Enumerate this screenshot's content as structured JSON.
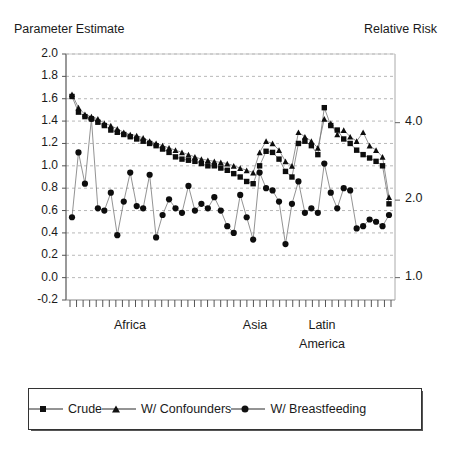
{
  "axes": {
    "left_title": "Parameter Estimate",
    "right_title": "Relative Risk",
    "left_ticks": [
      "2.0",
      "1.8",
      "1.6",
      "1.4",
      "1.2",
      "1.0",
      "0.8",
      "0.6",
      "0.4",
      "0.2",
      "0.0",
      "-0.2"
    ],
    "left_tick_values": [
      2.0,
      1.8,
      1.6,
      1.4,
      1.2,
      1.0,
      0.8,
      0.6,
      0.4,
      0.2,
      0.0,
      -0.2
    ],
    "right_ticks": [
      "4.0",
      "2.0",
      "1.0"
    ],
    "right_tick_values": [
      1.386,
      0.693,
      0.0
    ],
    "group_labels": [
      {
        "text": "Africa",
        "x": 130
      },
      {
        "text": "Asia",
        "x": 255
      },
      {
        "text": "Latin",
        "x": 322
      },
      {
        "text": "America",
        "x": 322
      }
    ]
  },
  "legend": {
    "items": [
      {
        "label": "Crude",
        "marker": "square"
      },
      {
        "label": "W/ Confounders",
        "marker": "triangle"
      },
      {
        "label": "W/ Breastfeeding",
        "marker": "circle"
      }
    ]
  },
  "chart_data": {
    "type": "line",
    "title": "",
    "subtitle": "",
    "xlabel": "",
    "ylabel": "Parameter Estimate",
    "y2label": "Relative Risk",
    "ylim": [
      -0.2,
      2.0
    ],
    "y2lim": [
      0.8187,
      7.389
    ],
    "y2_scale": "log",
    "grid": "horizontal-dashed",
    "legend_position": "bottom",
    "x_tick_count": 50,
    "x": [
      1,
      2,
      3,
      4,
      5,
      6,
      7,
      8,
      9,
      10,
      11,
      12,
      13,
      14,
      15,
      16,
      17,
      18,
      19,
      20,
      21,
      22,
      23,
      24,
      25,
      26,
      27,
      28,
      29,
      30,
      31,
      32,
      33,
      34,
      35,
      36,
      37,
      38,
      39,
      40,
      41,
      42,
      43,
      44,
      45,
      46,
      47,
      48,
      49,
      50
    ],
    "series": [
      {
        "name": "Crude",
        "marker": "square",
        "values": [
          1.62,
          1.48,
          1.44,
          1.42,
          1.39,
          1.36,
          1.32,
          1.3,
          1.28,
          1.26,
          1.24,
          1.22,
          1.2,
          1.18,
          1.15,
          1.12,
          1.08,
          1.06,
          1.05,
          1.04,
          1.02,
          1.0,
          1.0,
          0.98,
          0.96,
          0.93,
          0.9,
          0.86,
          0.84,
          1.0,
          1.13,
          1.12,
          1.06,
          0.95,
          0.9,
          1.2,
          1.22,
          1.18,
          1.1,
          1.52,
          1.36,
          1.32,
          1.24,
          1.2,
          1.14,
          1.1,
          1.07,
          1.04,
          1.0,
          0.66
        ]
      },
      {
        "name": "W/ Confounders",
        "marker": "triangle",
        "values": [
          1.64,
          1.52,
          1.46,
          1.44,
          1.42,
          1.38,
          1.36,
          1.33,
          1.3,
          1.28,
          1.27,
          1.25,
          1.22,
          1.2,
          1.18,
          1.16,
          1.14,
          1.12,
          1.1,
          1.08,
          1.06,
          1.05,
          1.04,
          1.03,
          1.02,
          1.0,
          0.98,
          0.96,
          0.94,
          1.12,
          1.22,
          1.2,
          1.14,
          1.04,
          1.0,
          1.3,
          1.26,
          1.22,
          1.16,
          1.42,
          1.38,
          1.28,
          1.32,
          1.26,
          1.22,
          1.3,
          1.18,
          1.14,
          1.08,
          0.72
        ]
      },
      {
        "name": "W/ Breastfeeding",
        "marker": "circle",
        "values": [
          0.54,
          1.12,
          0.84,
          1.42,
          0.62,
          0.6,
          0.76,
          0.38,
          0.68,
          0.94,
          0.64,
          0.62,
          0.92,
          0.36,
          0.56,
          0.7,
          0.62,
          0.58,
          0.82,
          0.6,
          0.66,
          0.62,
          0.72,
          0.6,
          0.46,
          0.4,
          0.74,
          0.54,
          0.34,
          0.94,
          0.8,
          0.78,
          0.68,
          0.3,
          0.66,
          0.86,
          0.58,
          0.62,
          0.58,
          1.02,
          0.76,
          0.62,
          0.8,
          0.78,
          0.44,
          0.46,
          0.52,
          0.5,
          0.46,
          0.56
        ]
      }
    ]
  }
}
